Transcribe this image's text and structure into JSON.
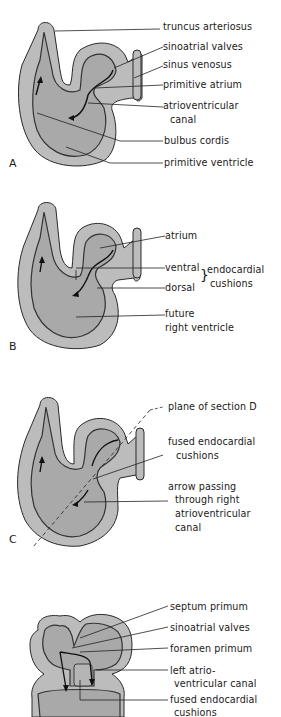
{
  "figure": {
    "panels": [
      {
        "id": "A",
        "letter": "A",
        "labels": {
          "truncus": "truncus arteriosus",
          "sa_valves": "sinoatrial valves",
          "sinus": "sinus venosus",
          "prim_atrium": "primitive atrium",
          "av_canal_1": "atrioventricular",
          "av_canal_2": "canal",
          "bulbus": "bulbus cordis",
          "prim_ventricle": "primitive ventricle"
        }
      },
      {
        "id": "B",
        "letter": "B",
        "labels": {
          "atrium": "atrium",
          "ventral": "ventral",
          "dorsal": "dorsal",
          "cushions_1": "endocardial",
          "cushions_2": "cushions",
          "future_1": "future",
          "future_2": "right ventricle"
        }
      },
      {
        "id": "C",
        "letter": "C",
        "labels": {
          "plane": "plane of section D",
          "fused_1": "fused endocardial",
          "fused_2": "cushions",
          "arrow_1": "arrow passing",
          "arrow_2": "through right",
          "arrow_3": "atrioventricular",
          "arrow_4": "canal"
        }
      },
      {
        "id": "D",
        "labels": {
          "septum": "septum primum",
          "sa_valves": "sinoatrial valves",
          "foramen": "foramen primum",
          "left_av_1": "left atrio-",
          "left_av_2": "ventricular canal",
          "fused_1": "fused endocardial",
          "fused_2": "cushions"
        }
      }
    ],
    "colors": {
      "wall": "#b9b9b9",
      "lumen": "#a8a8a8",
      "outline": "#2a2a2a",
      "ink": "#1a1a1a"
    }
  }
}
